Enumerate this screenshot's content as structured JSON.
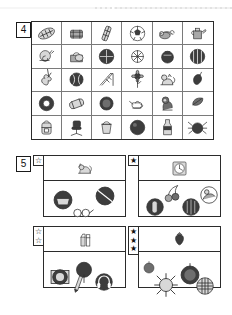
{
  "sheet": {
    "top_rule": "dotted-separator"
  },
  "exercise4": {
    "number": "4",
    "columns": 6,
    "rows": 5,
    "cells": [
      {
        "icon": "rugby-ball-icon",
        "label": "rugby ball"
      },
      {
        "icon": "drum-icon",
        "label": "drum"
      },
      {
        "icon": "chocolate-bar-icon",
        "label": "chocolate bar"
      },
      {
        "icon": "soccer-ball-icon",
        "label": "soccer ball"
      },
      {
        "icon": "mouse-icon",
        "label": "mouse"
      },
      {
        "icon": "watering-can-icon",
        "label": "watering can"
      },
      {
        "icon": "snail-icon",
        "label": "snail"
      },
      {
        "icon": "handbag-icon",
        "label": "handbag"
      },
      {
        "icon": "dark-ball-icon",
        "label": "dark ball"
      },
      {
        "icon": "shell-icon",
        "label": "shell"
      },
      {
        "icon": "teapot-dark-icon",
        "label": "dark teapot"
      },
      {
        "icon": "melon-icon",
        "label": "melon"
      },
      {
        "icon": "violin-icon",
        "label": "violin"
      },
      {
        "icon": "baseball-icon",
        "label": "baseball"
      },
      {
        "icon": "slide-icon",
        "label": "playground slide"
      },
      {
        "icon": "sunflower-icon",
        "label": "sunflower"
      },
      {
        "icon": "cat-icon",
        "label": "cat"
      },
      {
        "icon": "pepper-icon",
        "label": "pepper"
      },
      {
        "icon": "tyre-icon",
        "label": "tyre"
      },
      {
        "icon": "pillow-icon",
        "label": "pillow"
      },
      {
        "icon": "round-cake-icon",
        "label": "round cake"
      },
      {
        "icon": "teapot-icon",
        "label": "teapot"
      },
      {
        "icon": "gorilla-icon",
        "label": "gorilla"
      },
      {
        "icon": "leaf-icon",
        "label": "leaf"
      },
      {
        "icon": "backpack-icon",
        "label": "backpack"
      },
      {
        "icon": "office-chair-icon",
        "label": "office chair"
      },
      {
        "icon": "bucket-icon",
        "label": "bucket"
      },
      {
        "icon": "dark-sphere-icon",
        "label": "dark sphere"
      },
      {
        "icon": "bottle-icon",
        "label": "bottle"
      },
      {
        "icon": "spider-icon",
        "label": "spider"
      }
    ]
  },
  "exercise5": {
    "number": "5",
    "panels": [
      {
        "id": "panel-1",
        "difficulty": 1,
        "star_style": "outline",
        "stars": [
          "☆"
        ],
        "target": {
          "icon": "fox-icon",
          "label": "fox"
        },
        "options": [
          {
            "icon": "grey-bowl-icon",
            "label": "grey bowl"
          },
          {
            "icon": "dark-disc-icon",
            "label": "dark disc"
          },
          {
            "icon": "glasses-icon",
            "label": "glasses"
          }
        ]
      },
      {
        "id": "panel-2",
        "difficulty": 1,
        "star_style": "filled",
        "stars": [
          "★"
        ],
        "target": {
          "icon": "wall-clock-icon",
          "label": "wall clock"
        },
        "options": [
          {
            "icon": "dark-roll-icon",
            "label": "dark roll"
          },
          {
            "icon": "cherries-icon",
            "label": "cherries"
          },
          {
            "icon": "dark-onion-icon",
            "label": "dark onion"
          },
          {
            "icon": "circle-scene-icon",
            "label": "circled scene"
          }
        ]
      },
      {
        "id": "panel-3",
        "difficulty": 2,
        "star_style": "outline",
        "stars": [
          "☆",
          "☆"
        ],
        "target": {
          "icon": "milk-carton-icon",
          "label": "milk carton"
        },
        "options": [
          {
            "icon": "grey-plate-icon",
            "label": "grey plate"
          },
          {
            "icon": "dark-tree-icon",
            "label": "dark tree"
          },
          {
            "icon": "pencil-icon",
            "label": "pencil"
          },
          {
            "icon": "headphones-icon",
            "label": "headphones"
          }
        ]
      },
      {
        "id": "panel-4",
        "difficulty": 3,
        "star_style": "filled",
        "stars": [
          "★",
          "★",
          "★"
        ],
        "target": {
          "icon": "strawberry-icon",
          "label": "strawberry"
        },
        "options": [
          {
            "icon": "orange-ball-icon",
            "label": "orange ball"
          },
          {
            "icon": "spiky-burr-icon",
            "label": "spiky burr"
          },
          {
            "icon": "dark-fruit-icon",
            "label": "dark fruit"
          },
          {
            "icon": "striped-ball-icon",
            "label": "striped ball"
          }
        ]
      }
    ]
  },
  "colors": {
    "ink": "#2b2b2b",
    "grid_line": "#7a7a7a",
    "paper": "#ffffff",
    "fill_light": "#d8d8d8",
    "fill_mid": "#a8a8a8",
    "fill_dark": "#6e6e6e"
  }
}
